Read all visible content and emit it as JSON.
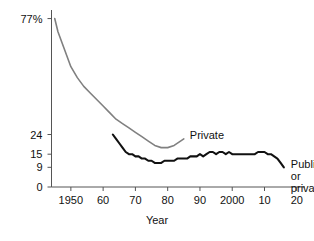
{
  "chart_data": {
    "type": "line",
    "title": "",
    "subtitle": "",
    "xlabel": "Year",
    "ylabel": "",
    "grid": false,
    "legend_position": "inline-at-line-end",
    "xlim": [
      1944,
      2021
    ],
    "ylim": [
      0,
      80
    ],
    "x_ticks": [
      {
        "value": 1950,
        "label": "1950"
      },
      {
        "value": 1960,
        "label": "60"
      },
      {
        "value": 1970,
        "label": "70"
      },
      {
        "value": 1980,
        "label": "80"
      },
      {
        "value": 1990,
        "label": "90"
      },
      {
        "value": 2000,
        "label": "2000"
      },
      {
        "value": 2010,
        "label": "10"
      },
      {
        "value": 2020,
        "label": "20"
      }
    ],
    "y_ticks": [
      {
        "value": 77,
        "label": "77%"
      },
      {
        "value": 24,
        "label": "24"
      },
      {
        "value": 15,
        "label": "15"
      },
      {
        "value": 9,
        "label": "9"
      },
      {
        "value": 0,
        "label": "0"
      }
    ],
    "series": [
      {
        "name": "Private",
        "label": "Private",
        "color": "#808080",
        "label_lines": [
          "Private"
        ],
        "x": [
          1945,
          1946,
          1948,
          1950,
          1952,
          1954,
          1956,
          1958,
          1960,
          1962,
          1964,
          1966,
          1968,
          1970,
          1972,
          1974,
          1976,
          1978,
          1980,
          1982,
          1985
        ],
        "values": [
          77,
          71,
          63,
          55,
          50,
          46,
          43,
          40,
          37,
          34,
          31,
          29,
          27,
          25,
          23,
          21,
          19,
          18,
          18,
          19,
          22
        ]
      },
      {
        "name": "Public or private",
        "label": "Public or private",
        "color": "#111111",
        "label_lines": [
          "Public or",
          "private"
        ],
        "x": [
          1963,
          1964,
          1965,
          1966,
          1967,
          1968,
          1969,
          1970,
          1971,
          1972,
          1973,
          1974,
          1975,
          1976,
          1977,
          1978,
          1979,
          1980,
          1981,
          1982,
          1983,
          1984,
          1985,
          1986,
          1987,
          1988,
          1989,
          1990,
          1991,
          1992,
          1993,
          1994,
          1995,
          1996,
          1997,
          1998,
          1999,
          2000,
          2001,
          2002,
          2003,
          2004,
          2005,
          2006,
          2007,
          2008,
          2009,
          2010,
          2011,
          2012,
          2013,
          2014,
          2015,
          2016
        ],
        "values": [
          24,
          22,
          20,
          18,
          16,
          15,
          15,
          14,
          14,
          13,
          13,
          12,
          12,
          11,
          11,
          11,
          12,
          12,
          12,
          12,
          13,
          13,
          13,
          13,
          14,
          14,
          14,
          15,
          14,
          15,
          16,
          16,
          15,
          16,
          16,
          15,
          16,
          15,
          15,
          15,
          15,
          15,
          15,
          15,
          15,
          16,
          16,
          16,
          15,
          15,
          14,
          13,
          11,
          9
        ]
      }
    ]
  },
  "axis": {
    "y_axis_name": "value-axis",
    "x_axis_name": "year-axis"
  }
}
